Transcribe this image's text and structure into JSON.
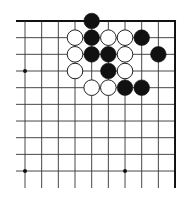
{
  "diagram": {
    "type": "go-board-corner",
    "grid": {
      "origin_x": 25,
      "origin_y": 21,
      "spacing": 16.67,
      "columns": 10,
      "rows": 10,
      "left_extend_x": 16,
      "bottom_extend_y": 188,
      "line_color": "#333333",
      "edge_color": "#111111"
    },
    "star_points": [
      {
        "col": 0,
        "row": 3
      },
      {
        "col": 0,
        "row": 9
      },
      {
        "col": 6,
        "row": 9
      }
    ],
    "stones": [
      {
        "color": "black",
        "col": 4,
        "row": 0
      },
      {
        "color": "black",
        "col": 4,
        "row": 1
      },
      {
        "color": "black",
        "col": 7,
        "row": 1
      },
      {
        "color": "black",
        "col": 4,
        "row": 2
      },
      {
        "color": "black",
        "col": 5,
        "row": 2
      },
      {
        "color": "black",
        "col": 8,
        "row": 2
      },
      {
        "color": "black",
        "col": 5,
        "row": 3
      },
      {
        "color": "black",
        "col": 6,
        "row": 4
      },
      {
        "color": "black",
        "col": 7,
        "row": 4
      },
      {
        "color": "white",
        "col": 3,
        "row": 1
      },
      {
        "color": "white",
        "col": 5,
        "row": 1
      },
      {
        "color": "white",
        "col": 6,
        "row": 1
      },
      {
        "color": "white",
        "col": 3,
        "row": 2
      },
      {
        "color": "white",
        "col": 6,
        "row": 2
      },
      {
        "color": "white",
        "col": 3,
        "row": 3
      },
      {
        "color": "white",
        "col": 6,
        "row": 3
      },
      {
        "color": "white",
        "col": 4,
        "row": 4
      },
      {
        "color": "white",
        "col": 5,
        "row": 4
      }
    ],
    "colors": {
      "black_stone": "#111111",
      "white_stone_fill": "#ffffff",
      "white_stone_stroke": "#222222"
    }
  }
}
